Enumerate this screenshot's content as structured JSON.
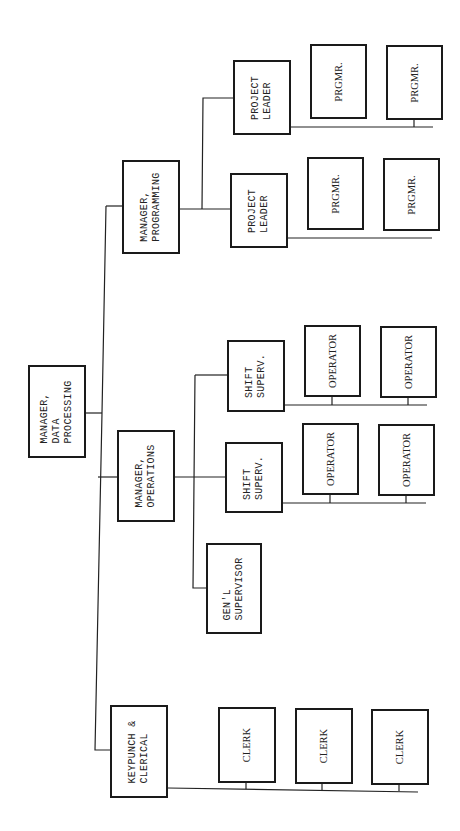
{
  "chart_title": "",
  "colors": {
    "line": "#222222",
    "box_border": "#1a1a1a",
    "background": "#ffffff",
    "text": "#222222"
  },
  "nodes": {
    "mdp": {
      "label": "MANAGER,\nDATA\nPROCESSING",
      "x": 28,
      "y": 365,
      "w": 58,
      "h": 93
    },
    "mprog": {
      "label": "MANAGER,\nPROGRAMMING",
      "x": 122,
      "y": 160,
      "w": 58,
      "h": 94
    },
    "mops": {
      "label": "MANAGER,\nOPERATIONS",
      "x": 117,
      "y": 430,
      "w": 58,
      "h": 92
    },
    "kp": {
      "label": "KEYPUNCH &\nCLERICAL",
      "x": 110,
      "y": 705,
      "w": 58,
      "h": 93
    },
    "pl1": {
      "label": "PROJECT\nLEADER",
      "x": 233,
      "y": 60,
      "w": 58,
      "h": 75
    },
    "pl2": {
      "label": "PROJECT\nLEADER",
      "x": 230,
      "y": 173,
      "w": 58,
      "h": 75
    },
    "ss1": {
      "label": "SHIFT\nSUPERV.",
      "x": 227,
      "y": 340,
      "w": 58,
      "h": 72
    },
    "ss2": {
      "label": "SHIFT\nSUPERV.",
      "x": 225,
      "y": 442,
      "w": 58,
      "h": 71
    },
    "gs": {
      "label": "GEN'L\nSUPERVISOR",
      "x": 206,
      "y": 543,
      "w": 56,
      "h": 91
    },
    "pg1": {
      "label": "PRGMR.",
      "x": 310,
      "y": 44,
      "w": 57,
      "h": 75
    },
    "pg2": {
      "label": "PRGMR.",
      "x": 386,
      "y": 45,
      "w": 57,
      "h": 75
    },
    "pg3": {
      "label": "PRGMR.",
      "x": 307,
      "y": 157,
      "w": 57,
      "h": 73
    },
    "pg4": {
      "label": "PRGMR.",
      "x": 383,
      "y": 158,
      "w": 57,
      "h": 73
    },
    "op1": {
      "label": "OPERATOR",
      "x": 304,
      "y": 325,
      "w": 57,
      "h": 72
    },
    "op2": {
      "label": "OPERATOR",
      "x": 380,
      "y": 326,
      "w": 57,
      "h": 72
    },
    "op3": {
      "label": "OPERATOR",
      "x": 302,
      "y": 423,
      "w": 57,
      "h": 72
    },
    "op4": {
      "label": "OPERATOR",
      "x": 378,
      "y": 424,
      "w": 57,
      "h": 72
    },
    "cl1": {
      "label": "CLERK",
      "x": 218,
      "y": 707,
      "w": 58,
      "h": 76
    },
    "cl2": {
      "label": "CLERK",
      "x": 295,
      "y": 708,
      "w": 58,
      "h": 76
    },
    "cl3": {
      "label": "CLERK",
      "x": 371,
      "y": 709,
      "w": 58,
      "h": 76
    }
  },
  "hierarchy": {
    "MANAGER, DATA PROCESSING": [
      "MANAGER, PROGRAMMING",
      "MANAGER, OPERATIONS",
      "KEYPUNCH & CLERICAL"
    ],
    "MANAGER, PROGRAMMING": [
      "PROJECT LEADER",
      "PROJECT LEADER"
    ],
    "PROJECT LEADER (upper)": [
      "PRGMR.",
      "PRGMR."
    ],
    "PROJECT LEADER (lower)": [
      "PRGMR.",
      "PRGMR."
    ],
    "MANAGER, OPERATIONS": [
      "SHIFT SUPERV.",
      "SHIFT SUPERV.",
      "GEN'L SUPERVISOR"
    ],
    "SHIFT SUPERV. (upper)": [
      "OPERATOR",
      "OPERATOR"
    ],
    "SHIFT SUPERV. (lower)": [
      "OPERATOR",
      "OPERATOR"
    ],
    "KEYPUNCH & CLERICAL": [
      "CLERK",
      "CLERK",
      "CLERK"
    ]
  }
}
